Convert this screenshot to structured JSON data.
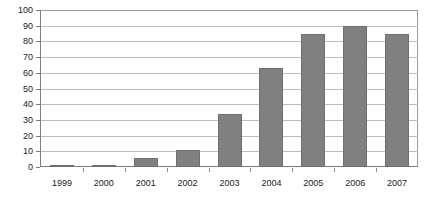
{
  "chart_data": {
    "type": "bar",
    "title": "",
    "subtitle": "",
    "xlabel": "",
    "ylabel": "",
    "categories": [
      "1999",
      "2000",
      "2001",
      "2002",
      "2003",
      "2004",
      "2005",
      "2006",
      "2007"
    ],
    "values": [
      0.5,
      1.5,
      6,
      11,
      34,
      63,
      85,
      90,
      85
    ],
    "series": [
      {
        "name": "",
        "values": [
          0.5,
          1.5,
          6,
          11,
          34,
          63,
          85,
          90,
          85
        ],
        "color": "#808080"
      }
    ],
    "ylim": [
      0,
      100
    ],
    "ytick_step": 10,
    "yticks": [
      0,
      10,
      20,
      30,
      40,
      50,
      60,
      70,
      80,
      90,
      100
    ],
    "ytick_labels": [
      "0",
      "10",
      "20",
      "30",
      "40",
      "50",
      "60",
      "70",
      "80",
      "90",
      "100"
    ],
    "grid": true,
    "grid_axis": "y",
    "legend": false,
    "legend_position": "none",
    "annotations": [],
    "colors": {
      "bar_fill": "#808080",
      "bar_border": "#6e6e6e",
      "gridline": "#bdbdbd",
      "axis": "#7d7d7d",
      "text": "#1a1a1a",
      "background": "#ffffff"
    }
  }
}
